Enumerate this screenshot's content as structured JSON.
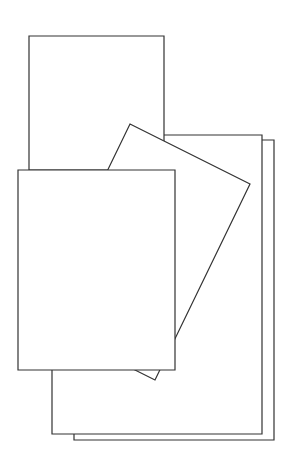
{
  "drawing": {
    "stroke": "#333333",
    "fill": "#ffffff",
    "shapes": [
      {
        "name": "back-sheet-rear",
        "points": "74,140 274,140 274,440 74,440"
      },
      {
        "name": "middle-sheet",
        "points": "52,135 262,135 262,434 52,434"
      },
      {
        "name": "top-back-sheet",
        "points": "29,36 164,36 164,170 29,170"
      },
      {
        "name": "tilted-sheet",
        "points": "130,124 250,184 155,380 35,320"
      },
      {
        "name": "front-sheet",
        "points": "18,170 175,170 175,370 18,370"
      }
    ]
  }
}
